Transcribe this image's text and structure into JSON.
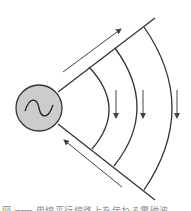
{
  "diagram": {
    "colors": {
      "line": "#333333",
      "arrow": "#444444",
      "source_fill": "#cccccc",
      "source_stroke": "#333333",
      "background": "#ffffff"
    },
    "source": {
      "type": "ac-source",
      "symbol": "sine-wave",
      "cx": 39,
      "cy": 108,
      "r": 23
    },
    "conductors": [
      {
        "name": "upper-conductor",
        "x1": 58,
        "y1": 92,
        "x2": 155,
        "y2": 18
      },
      {
        "name": "lower-conductor",
        "x1": 58,
        "y1": 124,
        "x2": 155,
        "y2": 200
      }
    ],
    "current_arrows": [
      {
        "name": "upper-current-arrow",
        "direction": "away-from-source",
        "x1": 63,
        "y1": 72,
        "x2": 121,
        "y2": 29
      },
      {
        "name": "lower-current-arrow",
        "direction": "toward-source",
        "x1": 122,
        "y1": 187,
        "x2": 64,
        "y2": 140
      }
    ],
    "wavefronts": [
      {
        "name": "wavefront-1",
        "top": [
          89,
          67
        ],
        "apex": [
          109,
          108
        ],
        "bottom": [
          92,
          149
        ]
      },
      {
        "name": "wavefront-2",
        "top": [
          115,
          48
        ],
        "apex": [
          137,
          108
        ],
        "bottom": [
          114,
          166
        ]
      },
      {
        "name": "wavefront-3",
        "top": [
          144,
          27
        ],
        "apex": [
          172,
          108
        ],
        "bottom": [
          144,
          190
        ]
      }
    ],
    "field_arrows": [
      {
        "name": "field-arrow-1",
        "x": 116,
        "y1": 90,
        "y2": 118
      },
      {
        "name": "field-arrow-2",
        "x": 143,
        "y1": 90,
        "y2": 118
      },
      {
        "name": "field-arrow-3",
        "x": 177,
        "y1": 90,
        "y2": 118
      }
    ]
  },
  "caption": {
    "text": "図 ─── 単線平行線路上を伝わる電磁波"
  }
}
